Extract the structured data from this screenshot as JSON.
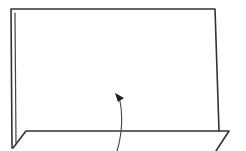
{
  "diagram": {
    "type": "fold-illustration",
    "stroke_color": "#333333",
    "background_color": "#ffffff",
    "elements": [
      {
        "name": "back-panel",
        "shape": "rectangle-outline"
      },
      {
        "name": "side-edge",
        "shape": "double-line"
      },
      {
        "name": "bottom-flap",
        "shape": "parallelogram"
      },
      {
        "name": "fold-arrow",
        "shape": "curved-arrow",
        "direction": "up"
      }
    ]
  }
}
